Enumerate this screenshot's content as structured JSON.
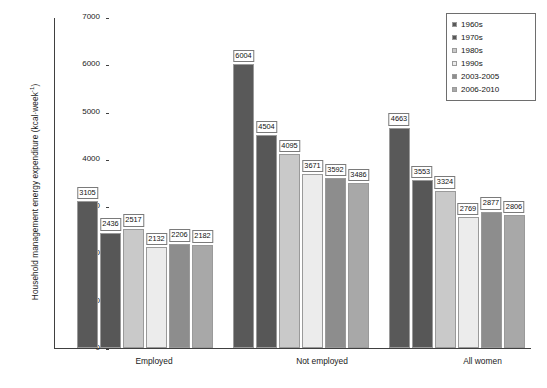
{
  "chart_data": {
    "type": "bar",
    "title": "",
    "subtitle": "",
    "xlabel": "",
    "ylabel": "Household management energy expenditure (kcal·week",
    "ylabel_exponent": "-1",
    "ylabel_suffix": ")",
    "categories": [
      "Employed",
      "Not employed",
      "All women"
    ],
    "ylim": [
      0,
      7000
    ],
    "ytick_labels": [
      "7000",
      "6000",
      "5000",
      "4000",
      "3000",
      "2000",
      "1000",
      "0"
    ],
    "ytick_values": [
      7000,
      6000,
      5000,
      4000,
      3000,
      2000,
      1000,
      0
    ],
    "grid": false,
    "legend_position": "top-right",
    "series": [
      {
        "name": "1960s",
        "color": "#595959",
        "values": [
          3105,
          6004,
          4663
        ]
      },
      {
        "name": "1970s",
        "color": "#575757",
        "values": [
          2436,
          4504,
          3553
        ]
      },
      {
        "name": "1980s",
        "color": "#c9c9c9",
        "values": [
          2517,
          4095,
          3324
        ]
      },
      {
        "name": "1990s",
        "color": "#ececec",
        "values": [
          2132,
          3671,
          2769
        ]
      },
      {
        "name": "2003-2005",
        "color": "#8d8d8d",
        "values": [
          2206,
          3592,
          2877
        ]
      },
      {
        "name": "2006-2010",
        "color": "#a8a8a8",
        "values": [
          2182,
          3486,
          2806
        ]
      }
    ],
    "bar_labels": {
      "Employed": [
        "3105",
        "2436",
        "2517",
        "2132",
        "2206",
        "2182"
      ],
      "Not employed": [
        "6004",
        "4504",
        "4095",
        "3671",
        "3592",
        "3486"
      ],
      "All women": [
        "4663",
        "3553",
        "3324",
        "2769",
        "2877",
        "2806"
      ]
    }
  },
  "legend": {
    "items": [
      {
        "label": "1960s",
        "color": "#595959"
      },
      {
        "label": "1970s",
        "color": "#575757"
      },
      {
        "label": "1980s",
        "color": "#c9c9c9"
      },
      {
        "label": "1990s",
        "color": "#ececec"
      },
      {
        "label": "2003-2005",
        "color": "#8d8d8d"
      },
      {
        "label": "2006-2010",
        "color": "#a8a8a8"
      }
    ]
  }
}
